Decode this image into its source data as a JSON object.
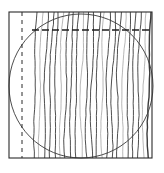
{
  "figure": {
    "type": "interferogram-diagram",
    "fringe_count": 23,
    "colors": {
      "background": "#ffffff",
      "ink": "#2a2a2a",
      "fringe": "#3a3a3a",
      "faint_fringe": "#9a9a9a"
    },
    "elements": {
      "frame": "square-border",
      "pupil": "circle",
      "reference_vertical": "dashed-line",
      "reference_horizontal": "dashed-line"
    }
  }
}
